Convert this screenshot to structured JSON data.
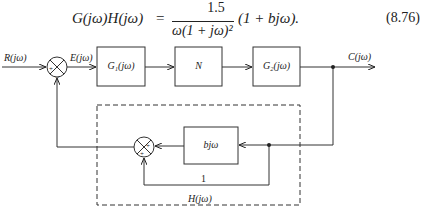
{
  "equation": {
    "lhs": "G(jω)H(jω)",
    "equals": "=",
    "numerator": "1.5",
    "denominator": "ω(1 + jω)²",
    "tail": "(1 + bjω).",
    "number": "(8.76)"
  },
  "diagram": {
    "input_label": "R(jω)",
    "error_label": "E(jω)",
    "output_label": "C(jω)",
    "blocks": {
      "g1": "G₁(jω)",
      "n": "N",
      "g2": "G₂(jω)",
      "bjw": "bjω"
    },
    "summer1_signs": {
      "left": "+",
      "bottom": "−"
    },
    "summer2_signs": {
      "right": "+",
      "bottom": "+"
    },
    "unity_gain_label": "1",
    "feedback_box_label": "H(jω)"
  }
}
